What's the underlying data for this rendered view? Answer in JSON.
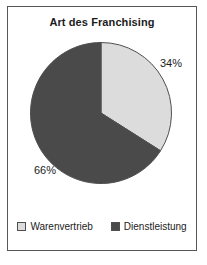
{
  "frame": {
    "border_color": "#58585a",
    "background": "#ffffff"
  },
  "chart_data": {
    "type": "pie",
    "title": "Art des Franchising",
    "xlabel": "",
    "ylabel": "",
    "legend_position": "bottom",
    "grid": false,
    "start_angle_deg": 0,
    "direction": "clockwise",
    "categories": [
      "Warenvertrieb",
      "Dienstleistung"
    ],
    "values": [
      34,
      66
    ],
    "value_labels": [
      "34%",
      "66%"
    ],
    "colors": [
      "#dcdcdc",
      "#4a4a4a"
    ],
    "slice_border_color": "#4f4f4f",
    "slices": [
      {
        "label": "Warenvertrieb",
        "value": 34,
        "value_label": "34%",
        "color": "#dcdcdc",
        "start_deg": 0,
        "end_deg": 122.4
      },
      {
        "label": "Dienstleistung",
        "value": 66,
        "value_label": "66%",
        "color": "#4a4a4a",
        "start_deg": 122.4,
        "end_deg": 360
      }
    ]
  },
  "legend": {
    "items": [
      {
        "label": "Warenvertrieb",
        "color": "#dcdcdc"
      },
      {
        "label": "Dienstleistung",
        "color": "#4a4a4a"
      }
    ]
  }
}
